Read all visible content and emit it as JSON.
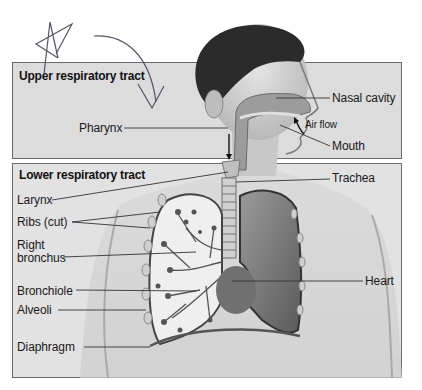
{
  "diagram": {
    "sections": {
      "upper": {
        "title": "Upper respiratory tract",
        "labels": {
          "nasal_cavity": "Nasal cavity",
          "air_flow": "Air flow",
          "mouth": "Mouth",
          "pharynx": "Pharynx"
        }
      },
      "lower": {
        "title": "Lower respiratory tract",
        "labels": {
          "larynx": "Larynx",
          "trachea": "Trachea",
          "ribs_cut": "Ribs (cut)",
          "right_bronchus_line1": "Right",
          "right_bronchus_line2": "bronchus",
          "bronchiole": "Bronchiole",
          "alveoli": "Alveoli",
          "heart": "Heart",
          "diaphragm": "Diaphragm"
        }
      }
    },
    "annotations": {
      "handwritten": [
        "star-mark",
        "curved-arrow"
      ]
    },
    "colors": {
      "panel_upper": "#dcdcdc",
      "panel_lower": "#e2e2e2",
      "panel_border": "#6a6a6a",
      "pen_ink": "#555566"
    }
  }
}
